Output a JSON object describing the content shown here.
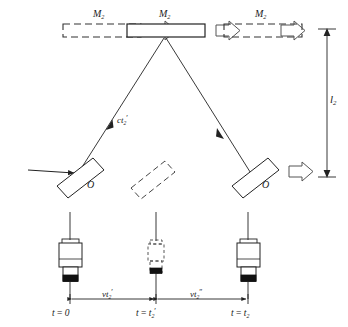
{
  "figure": {
    "type": "physics-ray-diagram",
    "stroke_color": "#222222",
    "background_color": "#ffffff"
  },
  "mirrors": {
    "left_ghost_label": "M",
    "left_ghost_sub": "2",
    "left_ghost_prime": "",
    "center_label": "M",
    "center_sub": "2",
    "center_prime": "",
    "right_ghost_label": "M",
    "right_ghost_sub": "2",
    "right_ghost_prime": ""
  },
  "beamsplitters": {
    "left_label": "O",
    "right_label": "O"
  },
  "raypath": {
    "up_leg_label": "ct",
    "up_leg_sub": "2",
    "up_leg_prime": "′"
  },
  "dimension": {
    "vertical_label": "l",
    "vertical_sub": "2"
  },
  "timeline": {
    "segments": [
      {
        "label": "vt",
        "sub": "2",
        "prime": "′"
      },
      {
        "label": "vt",
        "sub": "2",
        "prime": "″"
      }
    ],
    "ticks": [
      {
        "text_pre": "t = 0",
        "label": "t",
        "eq": "=",
        "value": "0",
        "sub": "",
        "prime": ""
      },
      {
        "text_pre": "t = t",
        "label": "t",
        "eq": "=",
        "value": "t",
        "sub": "2",
        "prime": "′"
      },
      {
        "text_pre": "t = t",
        "label": "t",
        "eq": "=",
        "value": "t",
        "sub": "2",
        "prime": ""
      }
    ]
  },
  "apparatus": {
    "left_state": "solid",
    "center_state": "dashed",
    "right_state": "solid",
    "count": 3
  }
}
